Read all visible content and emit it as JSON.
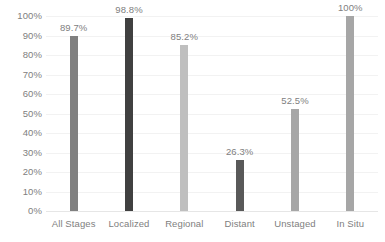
{
  "chart_data": {
    "type": "bar",
    "title": "",
    "subtitle": "",
    "xlabel": "",
    "ylabel": "",
    "ylim": [
      0,
      100
    ],
    "grid": true,
    "legend": "none",
    "categories": [
      "All Stages",
      "Localized",
      "Regional",
      "Distant",
      "Unstaged",
      "In Situ"
    ],
    "values": [
      89.7,
      98.8,
      85.2,
      26.3,
      52.5,
      100
    ],
    "data_labels": [
      "89.7%",
      "98.8%",
      "85.2%",
      "26.3%",
      "52.5%",
      "100%"
    ],
    "bar_colors": [
      "#808080",
      "#404040",
      "#bfbfbf",
      "#595959",
      "#a6a6a6",
      "#a6a6a6"
    ],
    "y_ticks": [
      0,
      10,
      20,
      30,
      40,
      50,
      60,
      70,
      80,
      90,
      100
    ],
    "y_tick_labels": [
      "0%",
      "10%",
      "20%",
      "30%",
      "40%",
      "50%",
      "60%",
      "70%",
      "80%",
      "90%",
      "100%"
    ]
  },
  "colors": {
    "background": "#ffffff",
    "gridline": "#f2f2f2",
    "axis_text": "#808080",
    "axis_line": "#e6e6e6"
  }
}
